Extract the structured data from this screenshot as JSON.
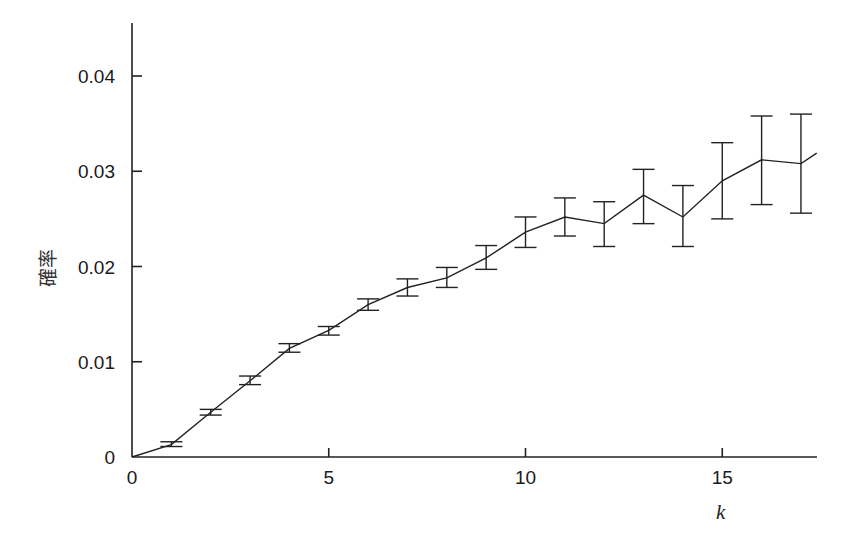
{
  "chart_data": {
    "type": "line",
    "title": "",
    "xlabel": "k",
    "ylabel": "確率",
    "xlim": [
      0,
      17.4
    ],
    "ylim": [
      0,
      0.0456
    ],
    "xticks": [
      0,
      5,
      10,
      15
    ],
    "xtick_labels": [
      "0",
      "5",
      "10",
      "15"
    ],
    "yticks": [
      0,
      0.01,
      0.02,
      0.03,
      0.04
    ],
    "ytick_labels": [
      "0",
      "0.01",
      "0.02",
      "0.03",
      "0.04"
    ],
    "grid": false,
    "legend": null,
    "series": [
      {
        "name": "確率",
        "error_bars": true,
        "points": [
          {
            "k": 0,
            "value": 0.0,
            "lo": null,
            "hi": null
          },
          {
            "k": 1,
            "value": 0.0013,
            "lo": 0.0011,
            "hi": 0.0016
          },
          {
            "k": 2,
            "value": 0.0047,
            "lo": 0.0044,
            "hi": 0.005
          },
          {
            "k": 3,
            "value": 0.008,
            "lo": 0.0076,
            "hi": 0.0085
          },
          {
            "k": 4,
            "value": 0.0114,
            "lo": 0.011,
            "hi": 0.0119
          },
          {
            "k": 5,
            "value": 0.0133,
            "lo": 0.0128,
            "hi": 0.0137
          },
          {
            "k": 6,
            "value": 0.016,
            "lo": 0.0154,
            "hi": 0.0166
          },
          {
            "k": 7,
            "value": 0.0178,
            "lo": 0.0169,
            "hi": 0.0187
          },
          {
            "k": 8,
            "value": 0.0188,
            "lo": 0.0178,
            "hi": 0.0199
          },
          {
            "k": 9,
            "value": 0.0209,
            "lo": 0.0197,
            "hi": 0.0222
          },
          {
            "k": 10,
            "value": 0.0236,
            "lo": 0.022,
            "hi": 0.0252
          },
          {
            "k": 11,
            "value": 0.0252,
            "lo": 0.0232,
            "hi": 0.0272
          },
          {
            "k": 12,
            "value": 0.0245,
            "lo": 0.0221,
            "hi": 0.0268
          },
          {
            "k": 13,
            "value": 0.0275,
            "lo": 0.0245,
            "hi": 0.0302
          },
          {
            "k": 14,
            "value": 0.0252,
            "lo": 0.0221,
            "hi": 0.0285
          },
          {
            "k": 15,
            "value": 0.029,
            "lo": 0.025,
            "hi": 0.033
          },
          {
            "k": 16,
            "value": 0.0312,
            "lo": 0.0265,
            "hi": 0.0358
          },
          {
            "k": 17,
            "value": 0.0308,
            "lo": 0.0256,
            "hi": 0.036
          },
          {
            "k": 17.4,
            "value": 0.0319,
            "lo": null,
            "hi": null
          }
        ]
      }
    ]
  },
  "layout": {
    "plot": {
      "x0": 132,
      "x_end": 817,
      "px_per_k": 39.35,
      "y0": 457,
      "px_per_unit": 9525,
      "y_top": 23
    }
  }
}
